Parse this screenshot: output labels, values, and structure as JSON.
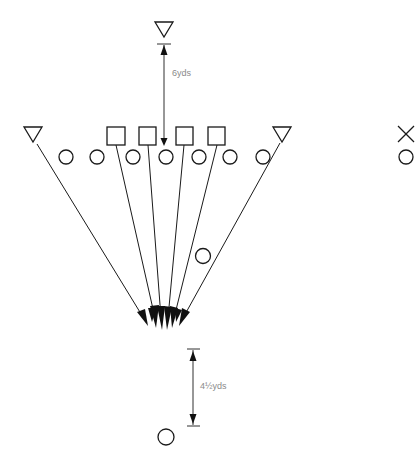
{
  "diagram": {
    "type": "football-play",
    "colors": {
      "stroke": "#1a1a1a",
      "label": "#8a8a8a",
      "background": "#ffffff"
    },
    "labels": {
      "top_distance": "6yds",
      "bottom_distance": "4½yds"
    },
    "defenders_triangle": [
      {
        "id": "top",
        "x": 164,
        "y": 28
      },
      {
        "id": "left-end",
        "x": 33,
        "y": 133
      },
      {
        "id": "right-end",
        "x": 282,
        "y": 133
      }
    ],
    "linemen_square": [
      {
        "x": 116,
        "y": 136
      },
      {
        "x": 148,
        "y": 136
      },
      {
        "x": 185,
        "y": 136
      },
      {
        "x": 217,
        "y": 136
      }
    ],
    "players_circle_line": [
      {
        "x": 66,
        "y": 157
      },
      {
        "x": 97,
        "y": 157
      },
      {
        "x": 133,
        "y": 157
      },
      {
        "x": 166,
        "y": 157
      },
      {
        "x": 199,
        "y": 157
      },
      {
        "x": 230,
        "y": 157
      },
      {
        "x": 263,
        "y": 157
      }
    ],
    "player_circle_backfield": {
      "x": 203,
      "y": 256
    },
    "player_circle_deep": {
      "x": 166,
      "y": 437
    },
    "legend_side": {
      "x_mark": {
        "x": 406,
        "y": 134
      },
      "circle": {
        "x": 406,
        "y": 156
      }
    },
    "convergence_point": {
      "x": 162,
      "y": 322
    }
  }
}
